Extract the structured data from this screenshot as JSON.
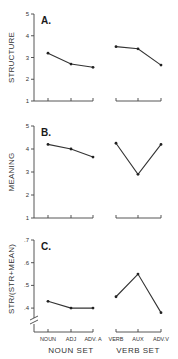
{
  "chart_data": [
    {
      "type": "line",
      "panel": "A.",
      "ylabel": "STRUCTURE",
      "ylim": [
        1,
        5
      ],
      "yticks": [
        "1",
        "2",
        "3",
        "4",
        "5"
      ],
      "grid": false,
      "groups": [
        {
          "name": "NOUN SET",
          "categories": [
            "NOUN",
            "ADJ",
            "ADV. A"
          ],
          "values": [
            3.2,
            2.7,
            2.55
          ]
        },
        {
          "name": "VERB SET",
          "categories": [
            "VERB",
            "AUX",
            "ADV.V"
          ],
          "values": [
            3.5,
            3.4,
            2.65
          ]
        }
      ]
    },
    {
      "type": "line",
      "panel": "B.",
      "ylabel": "MEANING",
      "ylim": [
        1,
        5
      ],
      "yticks": [
        "1",
        "2",
        "3",
        "4",
        "5"
      ],
      "grid": false,
      "groups": [
        {
          "name": "NOUN SET",
          "categories": [
            "NOUN",
            "ADJ",
            "ADV. A"
          ],
          "values": [
            4.2,
            4.0,
            3.65
          ]
        },
        {
          "name": "VERB SET",
          "categories": [
            "VERB",
            "AUX",
            "ADV.V"
          ],
          "values": [
            4.25,
            2.9,
            4.2
          ]
        }
      ]
    },
    {
      "type": "line",
      "panel": "C.",
      "ylabel": "STR/(STR+MEAN)",
      "ylim": [
        0.33,
        0.7
      ],
      "yticks": [
        ".4",
        ".5",
        ".6",
        ".7"
      ],
      "axis_break": true,
      "grid": false,
      "groups": [
        {
          "name": "NOUN SET",
          "categories": [
            "NOUN",
            "ADJ",
            "ADV. A"
          ],
          "values": [
            0.43,
            0.4,
            0.4
          ]
        },
        {
          "name": "VERB SET",
          "categories": [
            "VERB",
            "AUX",
            "ADV.V"
          ],
          "values": [
            0.45,
            0.55,
            0.38
          ]
        }
      ],
      "xlabel_groups": [
        "NOUN SET",
        "VERB SET"
      ]
    }
  ],
  "labels": {
    "panelA": "A.",
    "panelB": "B.",
    "panelC": "C.",
    "ylabelA": "STRUCTURE",
    "ylabelB": "MEANING",
    "ylabelC": "STR/(STR+MEAN)",
    "nounSet": "NOUN SET",
    "verbSet": "VERB SET",
    "cats": [
      "NOUN",
      "ADJ",
      "ADV. A",
      "VERB",
      "AUX",
      "ADV.V"
    ]
  }
}
